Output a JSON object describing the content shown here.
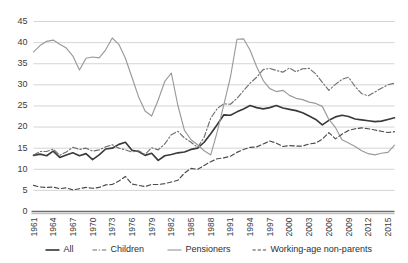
{
  "chart_data": {
    "type": "line",
    "title": "",
    "xlabel": "",
    "ylabel": "",
    "ylim": [
      0,
      45
    ],
    "ytick_step": 5,
    "yticks": [
      "0",
      "5",
      "10",
      "15",
      "20",
      "25",
      "30",
      "35",
      "40",
      "45"
    ],
    "grid": true,
    "legend_position": "bottom",
    "x_start": 1961,
    "x_end": 2016,
    "xticks": [
      "1961",
      "1964",
      "1967",
      "1970",
      "1973",
      "1976",
      "1979",
      "1982",
      "1985",
      "1988",
      "1991",
      "1994",
      "1997",
      "2000",
      "2003",
      "2006",
      "2009",
      "2012",
      "2015"
    ],
    "x": [
      1961,
      1962,
      1963,
      1964,
      1965,
      1966,
      1967,
      1968,
      1969,
      1970,
      1971,
      1972,
      1973,
      1974,
      1975,
      1976,
      1977,
      1978,
      1979,
      1980,
      1981,
      1982,
      1983,
      1984,
      1985,
      1986,
      1987,
      1988,
      1989,
      1990,
      1991,
      1992,
      1993,
      1994,
      1995,
      1996,
      1997,
      1998,
      1999,
      2000,
      2001,
      2002,
      2003,
      2004,
      2005,
      2006,
      2007,
      2008,
      2009,
      2010,
      2011,
      2012,
      2013,
      2014,
      2015,
      2016
    ],
    "series": [
      {
        "name": "All",
        "color": "#3a3a3a",
        "style": "solid",
        "values": [
          13.3,
          13.6,
          13.2,
          14.3,
          12.8,
          13.4,
          13.9,
          13.2,
          13.7,
          12.3,
          13.4,
          14.8,
          15.0,
          15.9,
          16.4,
          14.5,
          14.2,
          13.3,
          13.8,
          12.1,
          13.2,
          13.5,
          13.9,
          14.1,
          14.7,
          15.0,
          16.4,
          18.4,
          20.6,
          22.9,
          22.8,
          23.6,
          24.3,
          25.1,
          24.6,
          24.3,
          24.6,
          25.1,
          24.5,
          24.2,
          23.9,
          23.4,
          22.6,
          21.8,
          20.5,
          21.6,
          22.4,
          22.8,
          22.5,
          21.9,
          21.7,
          21.5,
          21.3,
          21.4,
          21.8,
          22.2
        ]
      },
      {
        "name": "Children",
        "color": "#6f6f6f",
        "style": "dashdot",
        "values": [
          13.4,
          14.2,
          14.2,
          14.8,
          13.3,
          14.1,
          15.2,
          14.7,
          15.0,
          14.3,
          14.6,
          15.3,
          15.8,
          15.0,
          14.6,
          14.1,
          14.4,
          13.5,
          15.1,
          14.6,
          16.0,
          18.2,
          19.0,
          17.4,
          16.4,
          15.2,
          17.6,
          22.1,
          24.4,
          25.5,
          25.4,
          26.8,
          28.6,
          30.4,
          31.8,
          33.6,
          33.9,
          33.4,
          33.0,
          34.0,
          33.1,
          33.8,
          33.9,
          32.6,
          30.6,
          28.7,
          30.1,
          31.3,
          31.8,
          29.6,
          27.9,
          27.4,
          28.3,
          29.2,
          30.0,
          30.4
        ]
      },
      {
        "name": "Pensioners",
        "color": "#9a9a9a",
        "style": "solid",
        "values": [
          37.8,
          39.3,
          40.3,
          40.6,
          39.6,
          38.7,
          36.8,
          33.5,
          36.3,
          36.6,
          36.4,
          38.3,
          41.1,
          39.6,
          36.3,
          31.8,
          27.2,
          23.8,
          22.6,
          26.4,
          30.8,
          32.8,
          25.1,
          19.2,
          17.0,
          15.8,
          14.4,
          13.4,
          18.9,
          25.3,
          31.8,
          40.8,
          40.9,
          38.2,
          34.3,
          31.0,
          29.1,
          28.4,
          28.7,
          27.5,
          26.8,
          26.5,
          25.9,
          25.6,
          24.9,
          21.8,
          19.9,
          17.0,
          16.2,
          15.4,
          14.4,
          13.7,
          13.4,
          13.8,
          14.0,
          15.7
        ]
      },
      {
        "name": "Working-age non-parents",
        "color": "#4a4a4a",
        "style": "dashed",
        "values": [
          6.2,
          5.8,
          5.7,
          5.8,
          5.4,
          5.6,
          5.1,
          5.4,
          5.7,
          5.5,
          5.7,
          6.3,
          6.4,
          7.2,
          8.3,
          6.5,
          6.2,
          5.9,
          6.4,
          6.4,
          6.6,
          7.0,
          7.4,
          9.1,
          10.2,
          10.0,
          10.9,
          11.8,
          12.5,
          12.7,
          13.1,
          14.0,
          14.7,
          15.2,
          15.3,
          16.0,
          16.7,
          16.2,
          15.4,
          15.6,
          15.5,
          15.5,
          16.0,
          16.2,
          17.1,
          18.7,
          17.2,
          18.3,
          19.2,
          19.6,
          19.8,
          19.6,
          19.3,
          19.0,
          18.7,
          18.9
        ]
      }
    ]
  },
  "legend": {
    "items": [
      {
        "label": "All"
      },
      {
        "label": "Children"
      },
      {
        "label": "Pensioners"
      },
      {
        "label": "Working-age non-parents"
      }
    ]
  }
}
